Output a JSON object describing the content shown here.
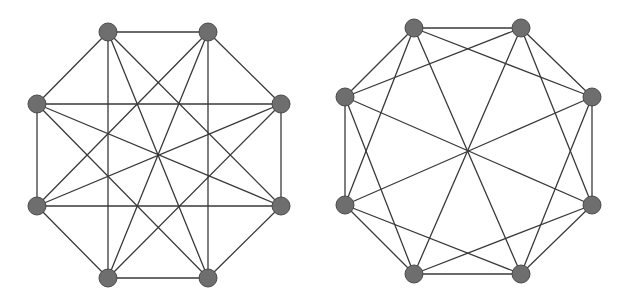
{
  "diagram": {
    "type": "graph-pair",
    "colors": {
      "edge": "#3a3a3a",
      "node_fill": "#6e6e6e",
      "node_stroke": "#4a4a4a",
      "background": "#ffffff"
    },
    "graphs": [
      {
        "name": "left-graph",
        "node_order_clockwise_from_top_left": [
          "A",
          "B",
          "C",
          "D",
          "E",
          "F",
          "G",
          "H"
        ],
        "edges": [
          [
            "A",
            "B"
          ],
          [
            "B",
            "C"
          ],
          [
            "C",
            "D"
          ],
          [
            "D",
            "E"
          ],
          [
            "E",
            "F"
          ],
          [
            "F",
            "G"
          ],
          [
            "G",
            "H"
          ],
          [
            "H",
            "A"
          ],
          [
            "A",
            "E"
          ],
          [
            "B",
            "F"
          ],
          [
            "C",
            "G"
          ],
          [
            "D",
            "H"
          ],
          [
            "A",
            "F"
          ],
          [
            "B",
            "E"
          ],
          [
            "H",
            "C"
          ],
          [
            "G",
            "D"
          ],
          [
            "A",
            "D"
          ],
          [
            "B",
            "G"
          ],
          [
            "H",
            "E"
          ],
          [
            "C",
            "F"
          ]
        ]
      },
      {
        "name": "right-graph",
        "node_order_clockwise_from_top_left": [
          "A",
          "B",
          "C",
          "D",
          "E",
          "F",
          "G",
          "H"
        ],
        "edges": [
          [
            "A",
            "B"
          ],
          [
            "B",
            "C"
          ],
          [
            "C",
            "D"
          ],
          [
            "D",
            "E"
          ],
          [
            "E",
            "F"
          ],
          [
            "F",
            "G"
          ],
          [
            "G",
            "H"
          ],
          [
            "H",
            "A"
          ],
          [
            "A",
            "E"
          ],
          [
            "B",
            "F"
          ],
          [
            "C",
            "G"
          ],
          [
            "D",
            "H"
          ],
          [
            "A",
            "C"
          ],
          [
            "B",
            "D"
          ],
          [
            "C",
            "E"
          ],
          [
            "D",
            "F"
          ],
          [
            "E",
            "G"
          ],
          [
            "F",
            "H"
          ],
          [
            "G",
            "A"
          ],
          [
            "H",
            "B"
          ]
        ]
      }
    ]
  }
}
